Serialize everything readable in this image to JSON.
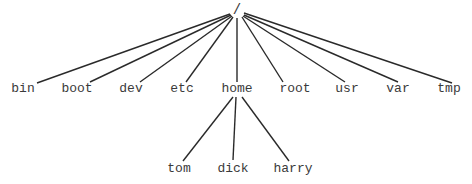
{
  "diagram": {
    "type": "directory-tree",
    "root": {
      "label": "/",
      "x": 237,
      "y": 4
    },
    "level1": [
      {
        "label": "bin",
        "x": 23,
        "y": 82
      },
      {
        "label": "boot",
        "x": 77,
        "y": 82
      },
      {
        "label": "dev",
        "x": 131,
        "y": 82
      },
      {
        "label": "etc",
        "x": 182,
        "y": 82
      },
      {
        "label": "home",
        "x": 237,
        "y": 82
      },
      {
        "label": "root",
        "x": 295,
        "y": 82
      },
      {
        "label": "usr",
        "x": 347,
        "y": 82
      },
      {
        "label": "var",
        "x": 398,
        "y": 82
      },
      {
        "label": "tmp",
        "x": 449,
        "y": 82
      }
    ],
    "level2_parent": "home",
    "level2": [
      {
        "label": "tom",
        "x": 179,
        "y": 162
      },
      {
        "label": "dick",
        "x": 233,
        "y": 162
      },
      {
        "label": "harry",
        "x": 293,
        "y": 162
      }
    ],
    "line_color": "#2a2a2a",
    "text_color": "#3a3a3a"
  }
}
